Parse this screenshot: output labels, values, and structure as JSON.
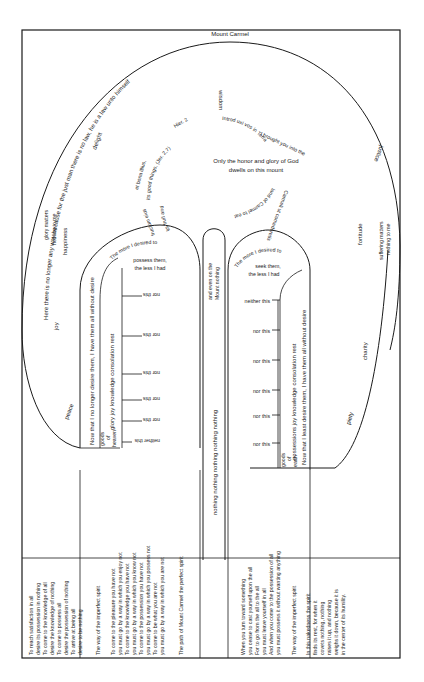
{
  "title": "Mount Carmel",
  "outer_arc_text": "Here there is no longer any way because for the just man there is no law, he is a law unto himself",
  "virtues": {
    "wisdom": "wisdom",
    "delight": "delight",
    "justice": "justice",
    "joy": "joy",
    "peace": "peace",
    "charity": "charity",
    "piety": "piety",
    "fortitude": "fortitude",
    "happiness": "happiness",
    "glory_matters": "glory matters",
    "nothing_to_me_1": "nothing to me",
    "suffering_matters": "suffering matters",
    "nothing_to_me_2": "nothing to me"
  },
  "summit": {
    "center_line1": "Only the honor and glory of God",
    "center_line2": "dwells on this mount",
    "left_arc_1": "Hier. 2",
    "left_arc_2": "et bona illius,",
    "left_arc_3": "its good things, (Jer. 2,7)",
    "left_arc_4": "fructum eius",
    "left_arc_5": "its fruit and",
    "right_arc_1": "Introd uxi vos in Terra",
    "right_arc_2": "Carmeli ut comederetis",
    "right_arc_3": "I brought you into the",
    "right_arc_4": "land of Carmel to eat"
  },
  "left_path": {
    "label": "Now that I no longer desire them, I have them all without desire",
    "header": "The more I desired to possess them, the less I had",
    "header_lines": [
      "The more I desired to",
      "possess them,",
      "the less I had"
    ],
    "goods_label": "goods of heaven",
    "goods_lines": [
      "goods",
      "of",
      "heaven"
    ],
    "items": "glory  joy  knowledge  consolation  rest",
    "rungs": [
      "nor this",
      "nor this",
      "nor this",
      "nor this",
      "nor this",
      "neither this"
    ]
  },
  "middle_path": {
    "label": "nothing nothing nothing nothing nothing",
    "top": "and even on the Mount nothing",
    "top_lines": [
      "and even on the",
      "Mount nothing"
    ]
  },
  "right_path": {
    "label": "Now that I least desire them, I have them all without desire",
    "header": "The more I desired to seek them, the less I had",
    "header_lines": [
      "The more I desired to",
      "seek them,",
      "the less I had"
    ],
    "goods_label": "goods of earth",
    "goods_lines": [
      "goods",
      "of",
      "earth"
    ],
    "items": "possessions  joy  knowledge  consolation  rest",
    "rungs": [
      "neither this",
      "nor this",
      "nor this",
      "nor this",
      "nor this",
      "nor this"
    ]
  },
  "bottom_panels": [
    {
      "lines": [
        "To reach satisfaction in all",
        "desire its possession in nothing",
        "To come to the knowledge of all",
        "desire the knowledge of nothing",
        "To come to possess all",
        "desire the possession of nothing",
        "To arrive at being all",
        "desire to be nothing"
      ]
    },
    {
      "heading": "The way of the imperfect spirit",
      "lines": [
        "To come to the pleasure you have not",
        "you must go by a way in which you enjoy not",
        "To come to the knowledge you have not",
        "you must go by a way in which you know not",
        "To come to the possession you have not",
        "you must go by a way in which you possess not",
        "To come to be what you are not",
        "you must go by a way in which you are not"
      ]
    },
    {
      "heading": "The path of Mount Carmel the perfect spirit",
      "lines": [
        "When you turn toward something",
        "you cease to cast yourself upon the all",
        "For to go from the all to the all",
        "you must leave yourself in all",
        "And when you come to the possession of all",
        "you must possess it without wanting anything"
      ]
    },
    {
      "heading": "The way of the imperfect spirit",
      "lines": [
        "In this nakedness the spirit",
        "finds its rest, for when it",
        "covets nothing, nothing",
        "raises it up, and nothing",
        "weighs it down, because it is",
        "in the center of its humility."
      ]
    }
  ],
  "colors": {
    "ink": "#1a1a1a",
    "paper": "#ffffff"
  }
}
